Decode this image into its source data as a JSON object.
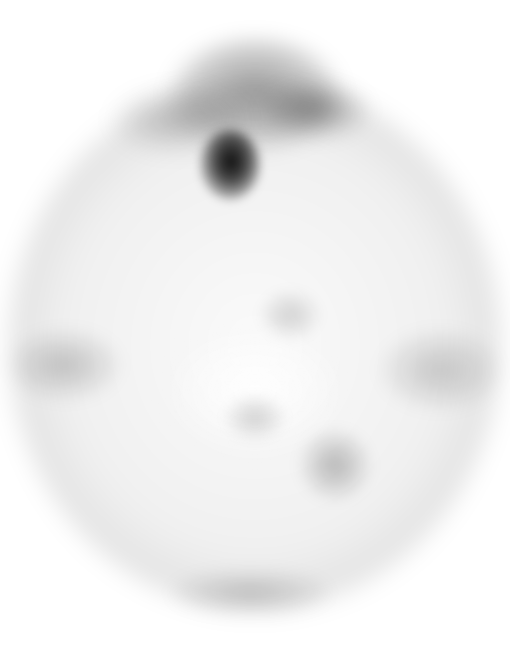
{
  "image": {
    "type": "grayscale axial brain scan",
    "background_color": "#ffffff",
    "foreground_color": "#000000",
    "regions": [
      {
        "name": "skull-outline",
        "intensity": "low"
      },
      {
        "name": "frontal-peak",
        "intensity": "medium"
      },
      {
        "name": "focal-hot-spot",
        "intensity": "high"
      },
      {
        "name": "temporal-bands",
        "intensity": "low-medium"
      },
      {
        "name": "occipital-spot",
        "intensity": "low-medium"
      },
      {
        "name": "posterior-rim",
        "intensity": "low"
      }
    ]
  }
}
